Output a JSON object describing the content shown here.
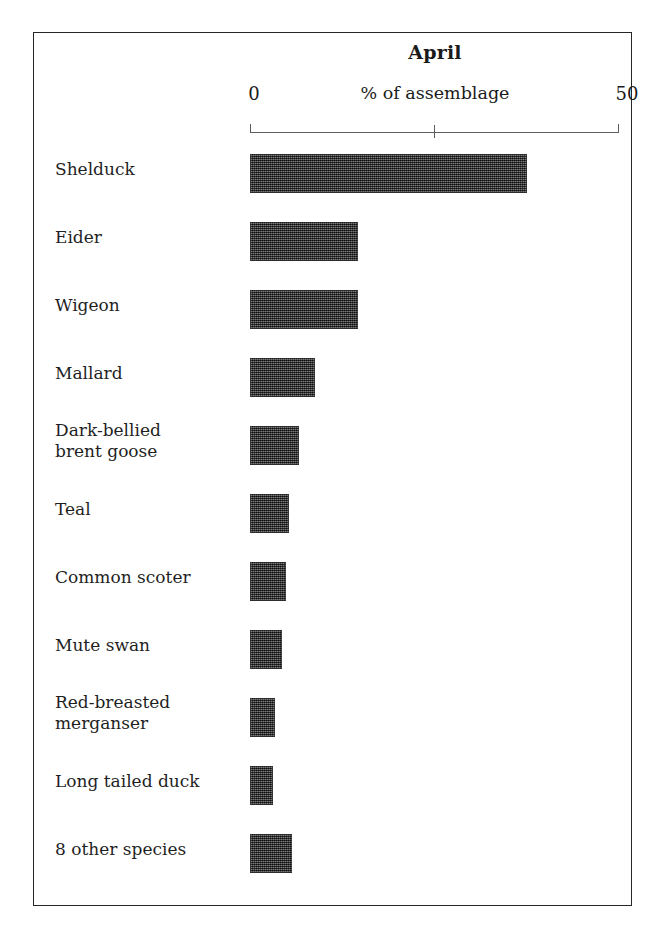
{
  "chart_data": {
    "type": "bar",
    "orientation": "horizontal",
    "title": "April",
    "xlabel": "% of assemblage",
    "ylabel": "",
    "xlim": [
      0,
      50
    ],
    "xticks": [
      0,
      25,
      50
    ],
    "xtick_labels": [
      "0",
      "",
      "50"
    ],
    "grid": false,
    "legend": null,
    "bar_color": "#474747",
    "frame_color": "#262626",
    "axis_color": "#5d5d5d",
    "categories": [
      "Shelduck",
      "Eider",
      "Wigeon",
      "Mallard",
      "Dark-bellied\nbrent goose",
      "Teal",
      "Common scoter",
      "Mute swan",
      "Red-breasted\nmerganser",
      "Long tailed duck",
      "8 other species"
    ],
    "values": [
      37.5,
      14.6,
      14.6,
      8.8,
      6.6,
      5.3,
      4.9,
      4.3,
      3.4,
      3.1,
      5.7
    ]
  },
  "axis": {
    "min_label": "0",
    "max_label": "50",
    "caption": "% of assemblage"
  },
  "header": {
    "title": "April"
  }
}
